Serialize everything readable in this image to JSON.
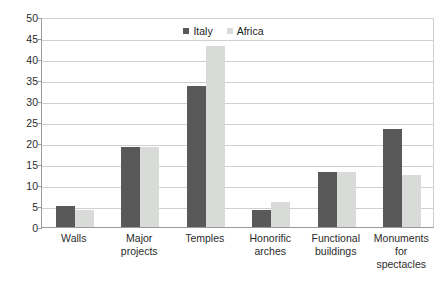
{
  "chart_data": {
    "type": "bar",
    "title": "",
    "subtitle": "",
    "xlabel": "",
    "ylabel": "",
    "ylim": [
      0,
      50
    ],
    "ytick_step": 5,
    "yticks": [
      0,
      5,
      10,
      15,
      20,
      25,
      30,
      35,
      40,
      45,
      50
    ],
    "grid": true,
    "legend_position": "top-center",
    "categories": [
      "Walls",
      "Major projects",
      "Temples",
      "Honorific arches",
      "Functional buildings",
      "Monuments for spectacles"
    ],
    "series": [
      {
        "name": "Italy",
        "color": "#595959",
        "values": [
          5,
          19,
          33.5,
          4,
          13,
          23.3
        ]
      },
      {
        "name": "Africa",
        "color": "#d9dbd8",
        "values": [
          4,
          19,
          43,
          6,
          13,
          12.5
        ]
      }
    ]
  },
  "colors": {
    "italy": "#595959",
    "africa": "#d9dbd8",
    "gridline": "#cfcfcf",
    "axis": "#9a9a9a",
    "text": "#2b2b2b",
    "background": "#ffffff"
  }
}
